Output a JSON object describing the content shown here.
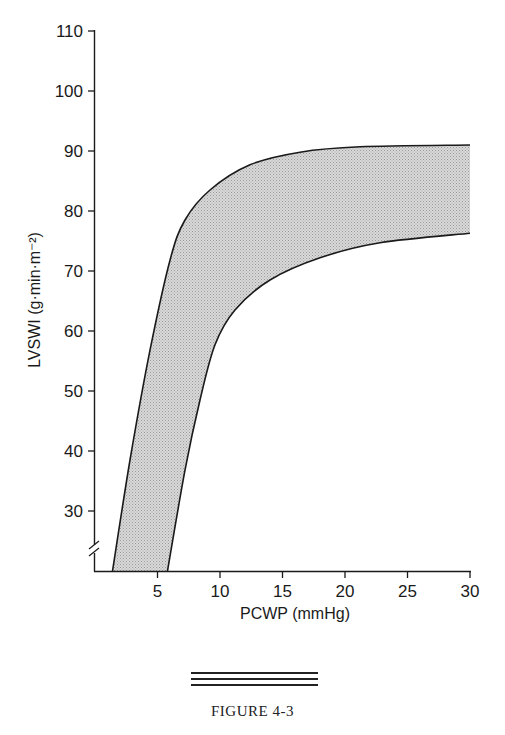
{
  "chart_data": {
    "type": "area",
    "title": "",
    "xlabel": "PCWP (mmHg)",
    "ylabel": "LVSWI (g·min·m⁻²)",
    "xlim": [
      0,
      30
    ],
    "ylim": [
      20,
      110
    ],
    "y_axis_break": true,
    "grid": false,
    "legend": null,
    "x_ticks": [
      5,
      10,
      15,
      20,
      25,
      30
    ],
    "y_ticks": [
      30,
      40,
      50,
      60,
      70,
      80,
      90,
      100,
      110
    ],
    "series": [
      {
        "name": "upper boundary",
        "x": [
          1.4,
          2.8,
          4.4,
          6.0,
          7.2,
          9.2,
          12.4,
          16.4,
          21.2,
          30.0
        ],
        "y": [
          20.0,
          38.5,
          56.8,
          71.8,
          78.5,
          83.5,
          87.7,
          89.8,
          90.7,
          91.0
        ]
      },
      {
        "name": "lower boundary",
        "x": [
          5.8,
          7.2,
          8.4,
          9.6,
          11.2,
          14.0,
          18.0,
          22.8,
          30.0
        ],
        "y": [
          20.0,
          36.8,
          48.5,
          57.7,
          63.5,
          68.5,
          72.2,
          74.7,
          76.3
        ]
      }
    ],
    "fill": "shaded band between upper and lower boundary"
  },
  "axis": {
    "x_title": "PCWP (mmHg)",
    "y_title": "LVSWI (g·min·m⁻²)",
    "x_tick_labels": [
      "5",
      "10",
      "15",
      "20",
      "25",
      "30"
    ],
    "y_tick_labels": [
      "30",
      "40",
      "50",
      "60",
      "70",
      "80",
      "90",
      "100",
      "110"
    ]
  },
  "caption": {
    "label": "FIGURE 4-3"
  },
  "colors": {
    "band_fill": "#cfcfcf",
    "line": "#1a1a1a"
  }
}
